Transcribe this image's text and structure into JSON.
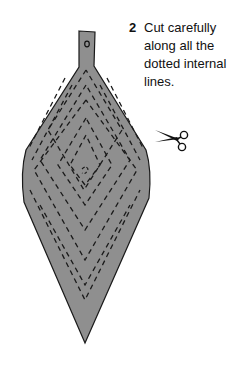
{
  "instruction": {
    "step_number": "2",
    "text": "Cut carefully along all the dotted internal lines."
  },
  "illustration": {
    "shape": "diamond-ornament-template",
    "fill_color": "#8f8f8f",
    "outline_color": "#1a1a1a",
    "cut_line_color": "#1a1a1a"
  },
  "icons": {
    "scissors": "scissors-icon"
  }
}
